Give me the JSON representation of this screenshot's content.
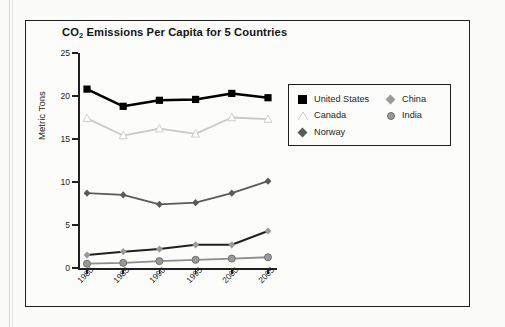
{
  "figure": {
    "title_main": "Emissions Per Capita for 5 Countries",
    "title_prefix": "CO",
    "title_sub": "2"
  },
  "axes": {
    "y_title": "Metric Tons",
    "y_ticks": [
      "25",
      "20",
      "15",
      "10",
      "5",
      "0"
    ],
    "y_min": 0,
    "y_max": 25,
    "x_ticks": [
      "1980",
      "1985",
      "1990",
      "1995",
      "2000",
      "2005"
    ]
  },
  "legend": {
    "left_column": [
      {
        "label": "United States",
        "marker": "filled-square-marker",
        "color": "#000000"
      },
      {
        "label": "Canada",
        "marker": "open-triangle-marker",
        "color": "#231f20"
      },
      {
        "label": "Norway",
        "marker": "filled-diamond-marker",
        "color": "#5a5a5a"
      }
    ],
    "right_column": [
      {
        "label": "China",
        "marker": "filled-diamond-marker",
        "color": "#9a9a9a"
      },
      {
        "label": "India",
        "marker": "filled-circle-marker",
        "color": "#9a9a9a"
      }
    ]
  },
  "chart_data": {
    "type": "line",
    "xlabel": "",
    "ylabel": "Metric Tons",
    "ylim": [
      0,
      25
    ],
    "ytick_step": 5,
    "grid": false,
    "legend_position": "right-inside",
    "x": [
      "1980",
      "1985",
      "1990",
      "1995",
      "2000",
      "2005"
    ],
    "series": [
      {
        "name": "United States",
        "marker": "square",
        "marker_color": "#000000",
        "line_color": "#000000",
        "values": [
          20.8,
          18.8,
          19.5,
          19.6,
          20.3,
          19.8
        ]
      },
      {
        "name": "Canada",
        "marker": "triangle",
        "marker_color": "#ffffff",
        "line_color": "#c9c9c9",
        "values": [
          17.4,
          15.4,
          16.2,
          15.6,
          17.5,
          17.3
        ]
      },
      {
        "name": "Norway",
        "marker": "diamond",
        "marker_color": "#5a5a5a",
        "line_color": "#5a5a5a",
        "values": [
          8.7,
          8.5,
          7.4,
          7.6,
          8.7,
          10.1
        ]
      },
      {
        "name": "China",
        "marker": "diamond",
        "marker_color": "#9a9a9a",
        "line_color": "#231f20",
        "values": [
          1.5,
          1.9,
          2.2,
          2.7,
          2.7,
          4.3
        ]
      },
      {
        "name": "India",
        "marker": "circle",
        "marker_color": "#9a9a9a",
        "line_color": "#8d8d8d",
        "values": [
          0.5,
          0.6,
          0.8,
          0.95,
          1.1,
          1.25
        ]
      }
    ]
  }
}
